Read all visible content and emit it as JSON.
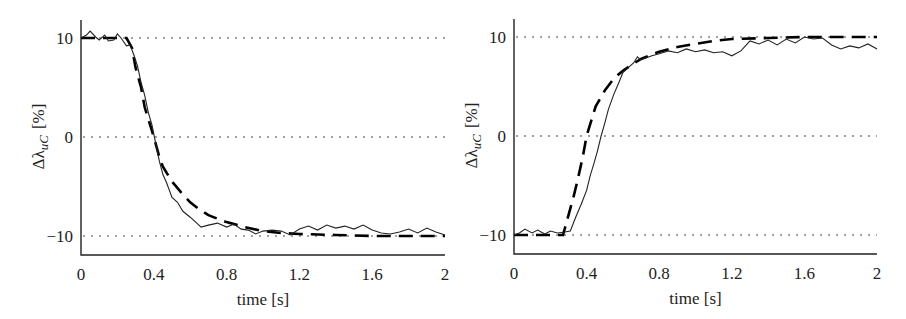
{
  "chart_data": [
    {
      "type": "line",
      "title": "",
      "xlabel": "time  [s]",
      "ylabel": "Δλ_uC  [%]",
      "xlim": [
        0,
        2
      ],
      "ylim": [
        -12,
        12
      ],
      "xticks": [
        "0",
        "0.4",
        "0.8",
        "1.2",
        "1.6",
        "2"
      ],
      "yticks": [
        "10",
        "0",
        "−10"
      ],
      "grid": "horizontal dotted at 10, 0, -10",
      "legend": "none",
      "series": [
        {
          "name": "model (dashed)",
          "style": "dashed",
          "x": [
            0,
            0.1,
            0.2,
            0.25,
            0.28,
            0.3,
            0.33,
            0.35,
            0.38,
            0.4,
            0.43,
            0.45,
            0.5,
            0.55,
            0.6,
            0.65,
            0.7,
            0.8,
            0.9,
            1.0,
            1.1,
            1.2,
            1.4,
            1.6,
            1.8,
            2.0
          ],
          "y": [
            10,
            10,
            10,
            10,
            9,
            7,
            5,
            3,
            1.2,
            0,
            -2,
            -3,
            -4.5,
            -5.6,
            -6.6,
            -7.3,
            -7.9,
            -8.6,
            -9.1,
            -9.5,
            -9.7,
            -9.8,
            -9.9,
            -10,
            -10,
            -10
          ]
        },
        {
          "name": "measured (solid)",
          "style": "solid",
          "x": [
            0,
            0.03,
            0.05,
            0.08,
            0.1,
            0.13,
            0.15,
            0.18,
            0.2,
            0.22,
            0.25,
            0.27,
            0.29,
            0.31,
            0.33,
            0.35,
            0.37,
            0.39,
            0.41,
            0.43,
            0.45,
            0.47,
            0.5,
            0.53,
            0.56,
            0.6,
            0.63,
            0.66,
            0.7,
            0.75,
            0.8,
            0.84,
            0.88,
            0.92,
            0.96,
            1.0,
            1.05,
            1.1,
            1.15,
            1.2,
            1.25,
            1.3,
            1.35,
            1.4,
            1.45,
            1.5,
            1.55,
            1.6,
            1.65,
            1.7,
            1.75,
            1.8,
            1.85,
            1.9,
            1.95,
            2.0
          ],
          "y": [
            10,
            10.3,
            10.7,
            10.1,
            9.8,
            10.3,
            9.7,
            9.8,
            10.4,
            10,
            9.2,
            9.3,
            8.3,
            7.2,
            5.5,
            4.2,
            2.5,
            1.2,
            -0.6,
            -2.4,
            -3.8,
            -4.6,
            -6.1,
            -6.6,
            -7.5,
            -8.1,
            -8.6,
            -9.1,
            -8.9,
            -8.7,
            -9.1,
            -8.8,
            -9.3,
            -9.4,
            -9.8,
            -9.5,
            -9.4,
            -9.5,
            -9.9,
            -9.3,
            -9.0,
            -9.4,
            -8.9,
            -9.2,
            -9.0,
            -9.3,
            -8.9,
            -9.4,
            -9.7,
            -9.8,
            -9.6,
            -9.3,
            -9.7,
            -9.2,
            -9.6,
            -9.9
          ]
        }
      ]
    },
    {
      "type": "line",
      "title": "",
      "xlabel": "time  [s]",
      "ylabel": "Δλ_uC  [%]",
      "xlim": [
        0,
        2
      ],
      "ylim": [
        -12,
        12
      ],
      "xticks": [
        "0",
        "0.4",
        "0.8",
        "1.2",
        "1.6",
        "2"
      ],
      "yticks": [
        "10",
        "0",
        "−10"
      ],
      "grid": "horizontal dotted at 10, 0, -10",
      "legend": "none",
      "series": [
        {
          "name": "model (dashed)",
          "style": "dashed",
          "x": [
            0,
            0.1,
            0.2,
            0.27,
            0.3,
            0.33,
            0.35,
            0.38,
            0.4,
            0.43,
            0.45,
            0.5,
            0.55,
            0.6,
            0.65,
            0.7,
            0.8,
            0.9,
            1.0,
            1.1,
            1.2,
            1.4,
            1.6,
            1.8,
            2.0
          ],
          "y": [
            -10,
            -10,
            -10,
            -10,
            -8,
            -6,
            -4.5,
            -2,
            0,
            1.8,
            3,
            4.6,
            5.8,
            6.6,
            7.2,
            7.8,
            8.5,
            9.0,
            9.3,
            9.6,
            9.8,
            9.9,
            10,
            10,
            10
          ]
        },
        {
          "name": "measured (solid)",
          "style": "solid",
          "x": [
            0,
            0.03,
            0.06,
            0.1,
            0.13,
            0.17,
            0.2,
            0.24,
            0.28,
            0.31,
            0.34,
            0.37,
            0.4,
            0.42,
            0.44,
            0.46,
            0.48,
            0.5,
            0.52,
            0.55,
            0.58,
            0.6,
            0.63,
            0.66,
            0.68,
            0.7,
            0.73,
            0.76,
            0.8,
            0.85,
            0.9,
            0.95,
            1.0,
            1.05,
            1.1,
            1.15,
            1.2,
            1.25,
            1.3,
            1.35,
            1.4,
            1.45,
            1.5,
            1.55,
            1.6,
            1.65,
            1.7,
            1.75,
            1.8,
            1.85,
            1.9,
            1.95,
            2.0
          ],
          "y": [
            -10,
            -9.8,
            -9.4,
            -9.8,
            -9.5,
            -9.9,
            -9.6,
            -9.8,
            -9.7,
            -9.6,
            -8.2,
            -6.9,
            -5.5,
            -4.0,
            -2.8,
            -1.5,
            0,
            1.3,
            2.7,
            4.2,
            5.5,
            6.4,
            6.9,
            7.4,
            8.0,
            7.7,
            7.9,
            8.1,
            8.3,
            8.6,
            8.4,
            8.8,
            8.5,
            8.7,
            8.4,
            8.5,
            8.1,
            8.6,
            9.6,
            9.3,
            9.7,
            9.2,
            9.8,
            9.4,
            10.0,
            9.8,
            9.9,
            9.2,
            8.8,
            9.1,
            8.9,
            9.3,
            8.8
          ]
        }
      ]
    }
  ],
  "plots": [
    {
      "xlabel": "time  [s]",
      "ylabel_main": "Δλ",
      "ylabel_sub": "uC",
      "ylabel_unit": "[%]"
    },
    {
      "xlabel": "time  [s]",
      "ylabel_main": "Δλ",
      "ylabel_sub": "uC",
      "ylabel_unit": "[%]"
    }
  ]
}
